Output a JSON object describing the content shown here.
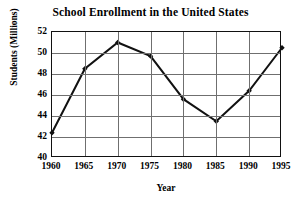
{
  "chart_data": {
    "type": "line",
    "title": "School Enrollment in the United States",
    "xlabel": "Year",
    "ylabel": "Students (Millions)",
    "x": [
      1960,
      1965,
      1970,
      1975,
      1980,
      1985,
      1990,
      1995
    ],
    "values": [
      42.4,
      48.5,
      51.0,
      49.7,
      45.6,
      43.5,
      46.4,
      50.5
    ],
    "xtick_labels": [
      "1960",
      "1965",
      "1970",
      "1975",
      "1980",
      "1985",
      "1990",
      "1995"
    ],
    "ytick_labels": [
      "40",
      "42",
      "44",
      "46",
      "48",
      "50",
      "52"
    ],
    "ytick_values": [
      40,
      42,
      44,
      46,
      48,
      50,
      52
    ],
    "xlim": [
      1960,
      1995
    ],
    "ylim": [
      40,
      52
    ],
    "grid": true,
    "legend": "none",
    "series_color": "#111111",
    "grid_color": "#6f6f6f",
    "marker": "diamond"
  }
}
